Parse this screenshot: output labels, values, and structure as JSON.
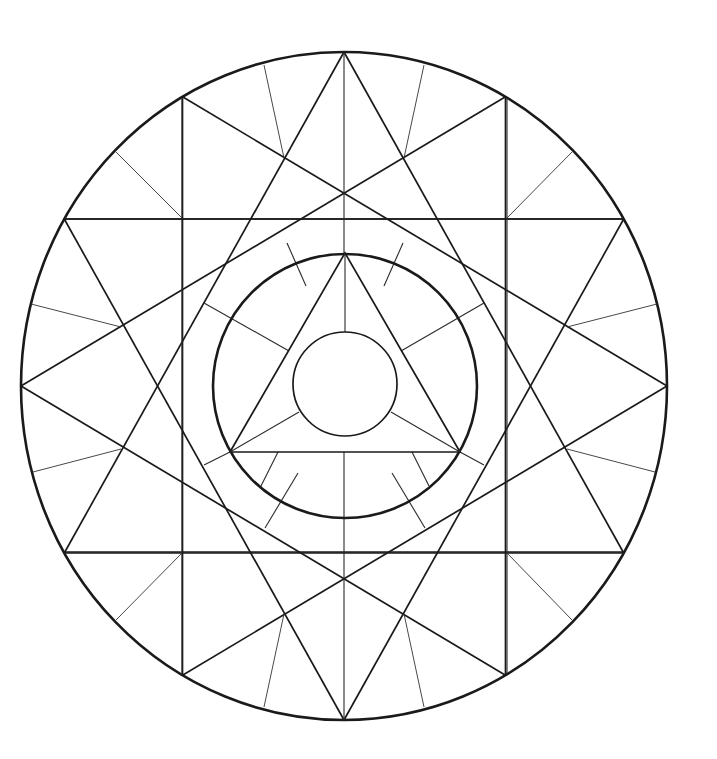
{
  "title": "Geometric mandala coloring page",
  "colors": {
    "ink": "#1a1a1a",
    "background": "#ffffff"
  },
  "canvas": {
    "width": 717,
    "height": 759
  },
  "center": {
    "x": 344,
    "y": 386
  },
  "outer_ellipse": {
    "rx": 323,
    "ry": 334
  },
  "middle_circle": {
    "cx": 345,
    "cy": 386,
    "r": 132
  },
  "inner_circle": {
    "cx": 345,
    "cy": 384,
    "r": 52
  },
  "star_points": 12,
  "star_step": 4,
  "square_horizontal": {
    "x1": 63,
    "x2": 623,
    "y1": 219,
    "y2": 552
  },
  "square_vertical": {
    "x1": 182,
    "x2": 507,
    "y1": 98,
    "y2": 673
  },
  "inner_triangle": [
    [
      345,
      253
    ],
    [
      230,
      452
    ],
    [
      460,
      452
    ]
  ],
  "center_lines": [
    [
      344,
      219,
      344,
      253
    ],
    [
      344,
      452,
      344,
      552
    ]
  ],
  "triangle_spokes": [
    [
      345,
      253,
      345,
      332
    ],
    [
      230,
      452,
      299,
      412
    ],
    [
      460,
      452,
      391,
      412
    ]
  ],
  "ring_spokes": [
    [
      287,
      243,
      306,
      286
    ],
    [
      403,
      243,
      384,
      286
    ],
    [
      204,
      303,
      289,
      351
    ],
    [
      484,
      303,
      401,
      351
    ],
    [
      204,
      465,
      230,
      452
    ],
    [
      484,
      465,
      460,
      452
    ],
    [
      261,
      486,
      278,
      452
    ],
    [
      429,
      486,
      412,
      452
    ],
    [
      265,
      528,
      298,
      473
    ],
    [
      425,
      528,
      392,
      473
    ]
  ],
  "outer_thin_spokes": [
    [
      264,
      65,
      284,
      158
    ],
    [
      424,
      65,
      404,
      158
    ],
    [
      116,
      152,
      182,
      218
    ],
    [
      572,
      152,
      507,
      218
    ],
    [
      31,
      304,
      121,
      327
    ],
    [
      657,
      304,
      567,
      327
    ],
    [
      33,
      472,
      121,
      449
    ],
    [
      655,
      472,
      567,
      449
    ],
    [
      116,
      620,
      182,
      553
    ],
    [
      572,
      620,
      507,
      553
    ],
    [
      264,
      707,
      284,
      614
    ],
    [
      424,
      707,
      404,
      614
    ]
  ]
}
